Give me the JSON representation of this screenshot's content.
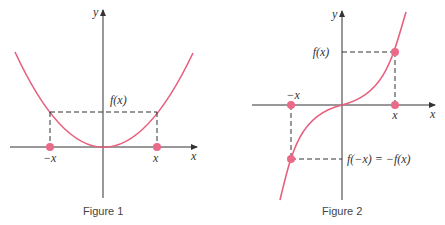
{
  "colors": {
    "curve": "#e8607f",
    "point": "#ea6a87",
    "axis": "#333333",
    "dash": "#333333"
  },
  "figure1": {
    "caption": "Figure 1",
    "y_label": "y",
    "x_label": "x",
    "fx_label": "f(x)",
    "neg_x_label": "−x",
    "pos_x_label": "x",
    "function_type": "even (parabola)"
  },
  "figure2": {
    "caption": "Figure 2",
    "y_label": "y",
    "x_label": "x",
    "fx_label": "f(x)",
    "neg_fx_label": "f(−x) = −f(x)",
    "neg_x_label": "−x",
    "pos_x_label": "x",
    "function_type": "odd (cubic)"
  }
}
